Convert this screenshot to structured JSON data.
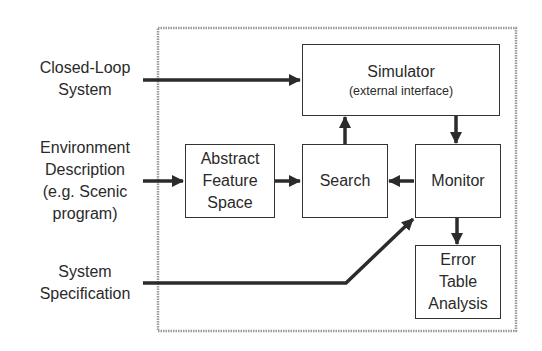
{
  "inputs": {
    "closed_loop": [
      "Closed-Loop",
      "System"
    ],
    "environment": [
      "Environment",
      "Description",
      "(e.g. Scenic",
      "program)"
    ],
    "specification": [
      "System",
      "Specification"
    ]
  },
  "blocks": {
    "simulator": {
      "title": "Simulator",
      "subtitle": "(external interface)"
    },
    "abstract": [
      "Abstract",
      "Feature",
      "Space"
    ],
    "search": "Search",
    "monitor": "Monitor",
    "error": [
      "Error",
      "Table",
      "Analysis"
    ]
  },
  "colors": {
    "line": "#2b2b2b",
    "frame": "#9a9a9a",
    "text": "#2a2a2a"
  }
}
